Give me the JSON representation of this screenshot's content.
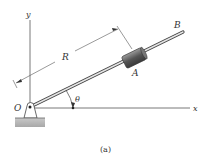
{
  "figure": {
    "caption": "(a)",
    "labels": {
      "y_axis": "y",
      "x_axis": "x",
      "origin": "O",
      "radius": "R",
      "collar": "A",
      "rod_end": "B",
      "angle": "θ"
    },
    "colors": {
      "axes": "#555555",
      "rod": "#777777",
      "collar": "#5a5a5a",
      "ground": "#b8b8b8"
    }
  }
}
